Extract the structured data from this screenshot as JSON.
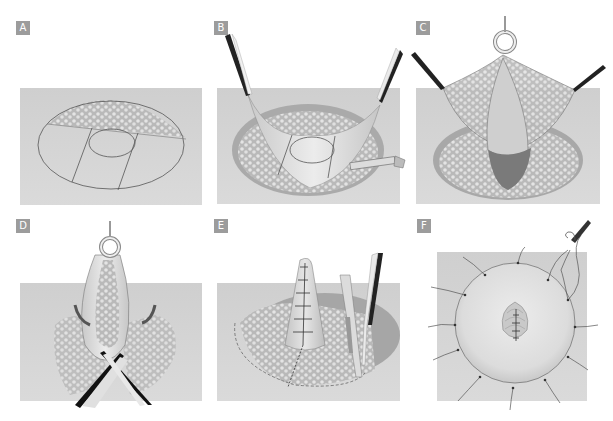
{
  "figure": {
    "panels": [
      {
        "id": "A",
        "label": "A",
        "description": "Elliptical incision outline with central circle and two parallel vertical lines across skin flap"
      },
      {
        "id": "B",
        "label": "B",
        "description": "Skin flap raised with two hooks while scalpel dissects beneath"
      },
      {
        "id": "C",
        "label": "C",
        "description": "Flap elevated by central clamp exposing fatty tissue cone"
      },
      {
        "id": "D",
        "label": "D",
        "description": "Flap folded inward with curved arrows; crossed scissors trimming tissue"
      },
      {
        "id": "E",
        "label": "E",
        "description": "Tissue cone sutured; dashed line marks excision outline; forceps and scalpel at right"
      },
      {
        "id": "F",
        "label": "F",
        "description": "Circular closure with radial sutures around central sutured nipple; needle holder top right"
      }
    ]
  },
  "colors": {
    "label_bg": "#9c9c9c",
    "label_text": "#ffffff",
    "panel_bg": "#d2d2d2",
    "cavity": "#bdbdbd",
    "fat_bubbles": "#e6e6e6",
    "flap": "#e2e2e2",
    "line": "#555555"
  }
}
